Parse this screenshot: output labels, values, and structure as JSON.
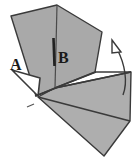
{
  "figure": {
    "type": "line-drawing",
    "width": 137,
    "height": 159,
    "background_color": "#ffffff",
    "fill_color": "#a9a9a9",
    "fill_color_light": "#b4b4b4",
    "stroke_color": "#3a3a3a",
    "crease_color": "#262626",
    "labels": [
      {
        "id": "label-a",
        "text": "A",
        "x": 16,
        "y": 67,
        "font_size": 15
      },
      {
        "id": "label-b",
        "text": "B",
        "x": 61,
        "y": 62,
        "font_size": 15
      }
    ],
    "shapes": {
      "upper_panel": {
        "name": "upper-gray-panel",
        "points": "11,16 57,5 102,32 95,72 55,88 36,96"
      },
      "lower_panel": {
        "name": "lower-gray-panel",
        "points": "38,97 55,88 131,72 130,121 104,156"
      },
      "left_flap": {
        "name": "left-triangular-flap",
        "points": "12,70 38,96 40,78"
      }
    },
    "creases": [
      {
        "name": "vertical-crease-b",
        "x1": 53,
        "y1": 38,
        "x2": 54,
        "y2": 66
      },
      {
        "name": "center-fold-line",
        "x1": 57,
        "y1": 5,
        "x2": 55,
        "y2": 88
      },
      {
        "name": "diagonal-fold-right",
        "x1": 55,
        "y1": 88,
        "x2": 95,
        "y2": 72
      },
      {
        "name": "diagonal-fold-lower",
        "x1": 55,
        "y1": 88,
        "x2": 131,
        "y2": 72
      },
      {
        "name": "diagonal-fold-left",
        "x1": 55,
        "y1": 88,
        "x2": 36,
        "y2": 96
      },
      {
        "name": "flap-edge-upper",
        "x1": 12,
        "y1": 70,
        "x2": 41,
        "y2": 77
      },
      {
        "name": "flap-edge-lower",
        "x1": 12,
        "y1": 71,
        "x2": 39,
        "y2": 97
      },
      {
        "name": "tick-mark",
        "x1": 27,
        "y1": 107,
        "x2": 34,
        "y2": 104
      },
      {
        "name": "bottom-edge-long",
        "x1": 38,
        "y1": 97,
        "x2": 130,
        "y2": 121
      }
    ],
    "arrow": {
      "name": "rotation-arrow",
      "path": "M 123,95 C 128,82 125,64 117,49",
      "head_points": "112,40 121,52 112,53",
      "stroke_color": "#3a3a3a"
    }
  }
}
